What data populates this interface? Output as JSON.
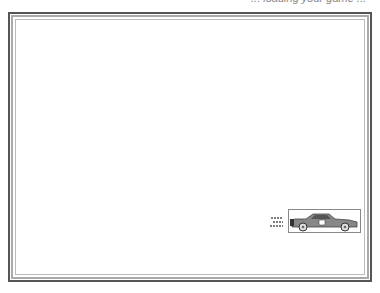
{
  "header": {
    "caption": "... loading your game ..."
  },
  "stage": {
    "sprite": {
      "name": "race-car",
      "colors": {
        "body": "#888888",
        "roof": "#555555",
        "wheel": "#dddddd"
      }
    }
  }
}
